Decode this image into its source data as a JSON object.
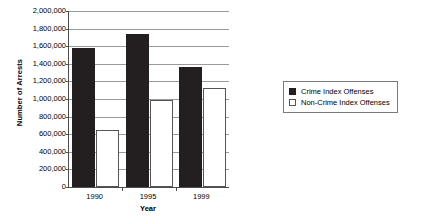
{
  "chart_data": {
    "type": "bar",
    "title": "",
    "xlabel": "Year",
    "ylabel": "Number of Arrests",
    "categories": [
      "1990",
      "1995",
      "1999"
    ],
    "series": [
      {
        "name": "Crime Index Offenses",
        "values": [
          1575000,
          1735000,
          1360000
        ],
        "color": "#231f20"
      },
      {
        "name": "Non-Crime Index Offenses",
        "values": [
          645000,
          990000,
          1130000
        ],
        "color": "#ffffff"
      }
    ],
    "ylim": [
      0,
      2000000
    ],
    "ytick_values": [
      0,
      200000,
      400000,
      600000,
      800000,
      1000000,
      1200000,
      1400000,
      1600000,
      1800000,
      2000000
    ],
    "ytick_labels": [
      "0",
      "200,000",
      "400,000",
      "600,000",
      "800,000",
      "1,000,000",
      "1,200,000",
      "1,400,000",
      "1,600,000",
      "1,800,000",
      "2,000,000"
    ],
    "grid": true,
    "legend_position": "right",
    "legend_entries": [
      "Crime Index Offenses",
      "Non-Crime Index Offenses"
    ]
  }
}
